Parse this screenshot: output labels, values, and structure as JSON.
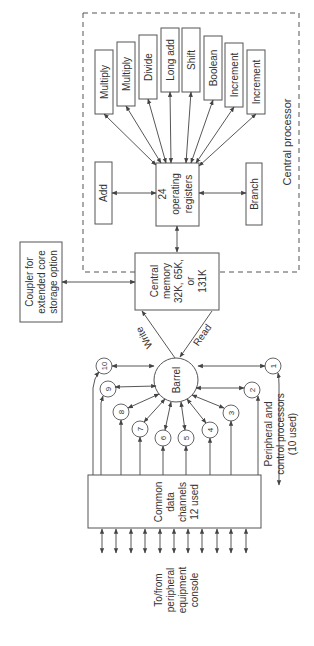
{
  "diagram": {
    "orientation": "rotated-90-ccw",
    "colors": {
      "line": "#444444",
      "box_border": "#555555",
      "text": "#333333",
      "background": "#ffffff"
    },
    "central_processor": {
      "label": "Central processor",
      "registers": {
        "lines": [
          "24",
          "operating",
          "registers"
        ]
      },
      "functional_units": [
        {
          "id": "multiply1",
          "label": "Multiply"
        },
        {
          "id": "multiply2",
          "label": "Multiply"
        },
        {
          "id": "divide",
          "label": "Divide"
        },
        {
          "id": "long_add",
          "label": "Long add"
        },
        {
          "id": "shift",
          "label": "Shift"
        },
        {
          "id": "boolean",
          "label": "Boolean"
        },
        {
          "id": "increment1",
          "label": "Increment"
        },
        {
          "id": "increment2",
          "label": "Increment"
        }
      ],
      "add": {
        "label": "Add"
      },
      "branch": {
        "label": "Branch"
      }
    },
    "central_memory": {
      "lines": [
        "Central",
        "memory",
        "32K, 65K,",
        "or",
        "131K"
      ]
    },
    "coupler": {
      "lines": [
        "Coupler for",
        "extended core",
        "storage option"
      ]
    },
    "barrel": {
      "label": "Barrel",
      "write_label": "Write",
      "read_label": "Read"
    },
    "peripheral_processors": {
      "label_lines": [
        "Peripheral and",
        "control processors",
        "(10 used)"
      ],
      "items": [
        "1",
        "2",
        "3",
        "4",
        "5",
        "6",
        "7",
        "8",
        "9",
        "10"
      ]
    },
    "common_data_channels": {
      "lines": [
        "Common",
        "data",
        "channels",
        "12 used"
      ],
      "external_arrow_count": 11
    },
    "external": {
      "lines": [
        "To/from",
        "peripheral",
        "equipment",
        "console"
      ]
    }
  }
}
